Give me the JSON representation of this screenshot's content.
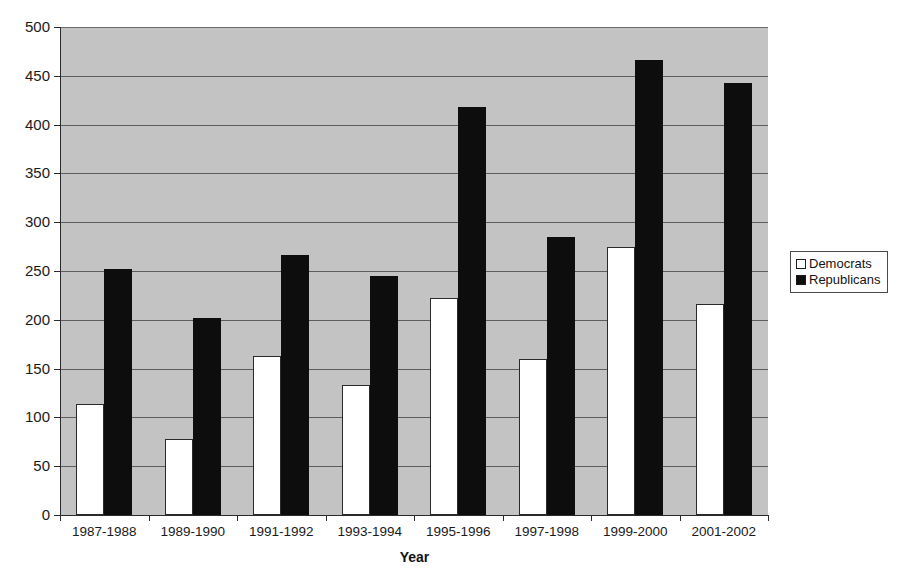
{
  "chart_data": {
    "type": "bar",
    "title": "",
    "subtitle": "",
    "xlabel": "Year",
    "ylabel": "",
    "ylim": [
      0,
      500
    ],
    "ytick_step": 50,
    "yticks": [
      0,
      50,
      100,
      150,
      200,
      250,
      300,
      350,
      400,
      450,
      500
    ],
    "grid": true,
    "grid_axis": "y",
    "legend_position": "right-outside",
    "plot_background": "#c3c3c3",
    "categories": [
      "1987-1988",
      "1989-1990",
      "1991-1992",
      "1993-1994",
      "1995-1996",
      "1997-1998",
      "1999-2000",
      "2001-2002"
    ],
    "series": [
      {
        "name": "Democrats",
        "color": "#ffffff",
        "edge_color": "#2a2a2a",
        "values": [
          114,
          78,
          163,
          133,
          222,
          160,
          275,
          216
        ]
      },
      {
        "name": "Republicans",
        "color": "#0d0d0d",
        "edge_color": "#0d0d0d",
        "values": [
          252,
          202,
          266,
          245,
          418,
          285,
          466,
          443
        ]
      }
    ]
  },
  "legend": {
    "items": [
      {
        "label": "Democrats",
        "swatch": "white-square-icon"
      },
      {
        "label": "Republicans",
        "swatch": "black-square-icon"
      }
    ]
  },
  "axis": {
    "x_title": "Year"
  },
  "caption": {
    "text": ""
  }
}
